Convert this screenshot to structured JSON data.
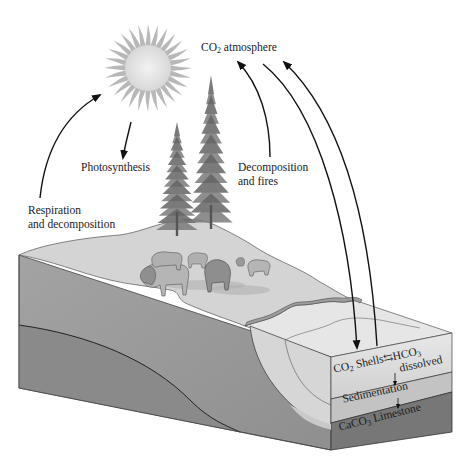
{
  "labels": {
    "co2_atmosphere": {
      "prefix": "CO",
      "sub": "2",
      "suffix": " atmosphere"
    },
    "photosynthesis": "Photosynthesis",
    "decomposition_fires_line1": "Decomposition",
    "decomposition_fires_line2": "and fires",
    "respiration_line1": "Respiration",
    "respiration_line2": "and decomposition",
    "co2_shells": {
      "prefix": "CO",
      "sub": "2",
      "suffix": " Shells"
    },
    "equilibrium_symbol": "⇆",
    "hco3": {
      "prefix": "HCO",
      "sub": "3"
    },
    "dissolved": "dissolved",
    "sedimentation": "Sedimentation",
    "limestone": {
      "prefix": "CaCO",
      "sub": "3",
      "suffix": " Limestone"
    }
  },
  "colors": {
    "sun_disk": "#e6e6e6",
    "sun_rays": "#b8b8b8",
    "land_surface": "#d2d2d2",
    "soil_upper": "#9a9a9a",
    "soil_lower": "#8c8c8c",
    "water_surface": "#e4e4e4",
    "water_body": "#d9d9d9",
    "sediment": "#c4c4c4",
    "limestone_layer": "#7a7a7a",
    "arrow": "#111111",
    "tree": "#6f6f6f"
  }
}
